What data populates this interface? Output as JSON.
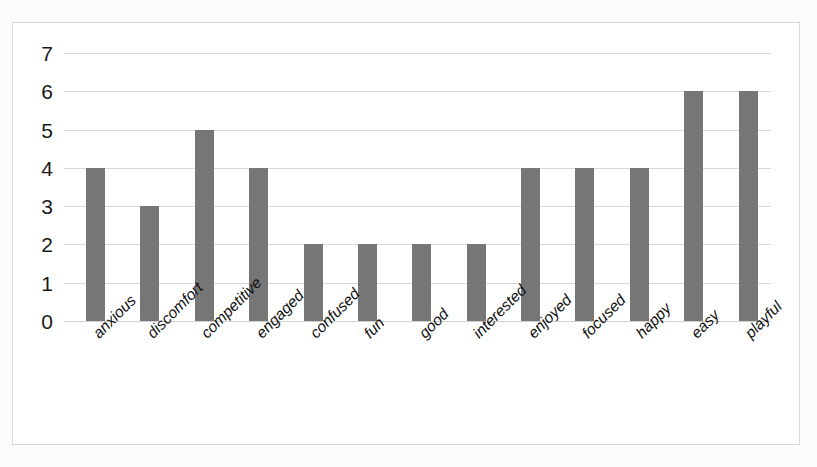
{
  "chart_data": {
    "type": "bar",
    "title": "",
    "subtitle": "",
    "xlabel": "",
    "ylabel": "",
    "ylim": [
      0,
      7
    ],
    "ytick_labels": [
      "0",
      "1",
      "2",
      "3",
      "4",
      "5",
      "6",
      "7"
    ],
    "ytick_values": [
      0,
      1,
      2,
      3,
      4,
      5,
      6,
      7
    ],
    "grid": true,
    "legend": false,
    "legend_position": "none",
    "xtick_rotation_degrees": 45,
    "bar_color": "#767676",
    "gridline_color": "#d9d9d9",
    "plot_background": "#ffffff",
    "frame_border_color": "#d8d8d8",
    "categories": [
      "anxious",
      "discomfort",
      "competitive",
      "engaged",
      "confused",
      "fun",
      "good",
      "interested",
      "enjoyed",
      "focused",
      "happy",
      "easy",
      "playful"
    ],
    "values": [
      4,
      3,
      5,
      4,
      2,
      2,
      2,
      2,
      4,
      4,
      4,
      6,
      6
    ]
  }
}
